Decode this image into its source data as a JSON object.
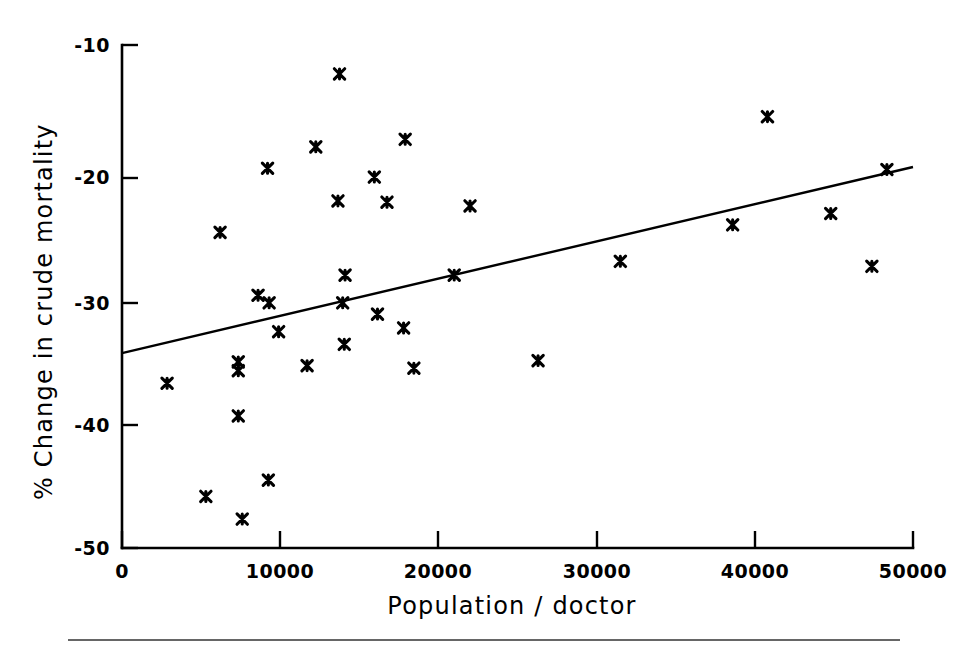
{
  "chart_data": {
    "type": "scatter",
    "title": "",
    "xlabel": "Population / doctor",
    "ylabel": "% Change in crude mortality",
    "xlim": [
      0,
      50000
    ],
    "ylim": [
      -50,
      -10
    ],
    "xticks": [
      0,
      10000,
      20000,
      30000,
      40000,
      50000
    ],
    "xtick_labels": [
      "0",
      "10000",
      "20000",
      "30000",
      "40000",
      "50000"
    ],
    "yticks": [
      -10,
      -20,
      -30,
      -40,
      -50
    ],
    "ytick_labels": [
      "-10",
      "-20",
      "-30",
      "-40",
      "-50"
    ],
    "grid": false,
    "legend": null,
    "marker": "x-star",
    "points": [
      {
        "x": 2850,
        "y": -36.9
      },
      {
        "x": 5300,
        "y": -45.9
      },
      {
        "x": 6200,
        "y": -24.9
      },
      {
        "x": 7350,
        "y": -35.2
      },
      {
        "x": 7350,
        "y": -35.9
      },
      {
        "x": 7350,
        "y": -39.5
      },
      {
        "x": 7600,
        "y": -47.7
      },
      {
        "x": 8600,
        "y": -29.9
      },
      {
        "x": 9200,
        "y": -19.8
      },
      {
        "x": 9250,
        "y": -44.6
      },
      {
        "x": 9300,
        "y": -30.5
      },
      {
        "x": 9900,
        "y": -32.8
      },
      {
        "x": 11700,
        "y": -35.5
      },
      {
        "x": 12250,
        "y": -18.1
      },
      {
        "x": 13650,
        "y": -22.4
      },
      {
        "x": 13750,
        "y": -12.3
      },
      {
        "x": 13950,
        "y": -30.5
      },
      {
        "x": 14100,
        "y": -28.3
      },
      {
        "x": 14050,
        "y": -33.8
      },
      {
        "x": 15950,
        "y": -20.5
      },
      {
        "x": 16150,
        "y": -31.4
      },
      {
        "x": 16750,
        "y": -22.5
      },
      {
        "x": 17800,
        "y": -32.5
      },
      {
        "x": 17900,
        "y": -17.5
      },
      {
        "x": 18450,
        "y": -35.7
      },
      {
        "x": 21000,
        "y": -28.3
      },
      {
        "x": 22000,
        "y": -22.8
      },
      {
        "x": 26300,
        "y": -35.1
      },
      {
        "x": 31500,
        "y": -27.2
      },
      {
        "x": 38600,
        "y": -24.3
      },
      {
        "x": 40800,
        "y": -15.7
      },
      {
        "x": 44800,
        "y": -23.4
      },
      {
        "x": 47400,
        "y": -27.6
      },
      {
        "x": 48350,
        "y": -19.9
      }
    ],
    "fit_line": {
      "x0": 0,
      "y0": -34.5,
      "x1": 50000,
      "y1": -19.7
    }
  },
  "figure": {
    "background_color": "#ffffff",
    "ink_color": "#000000",
    "bottom_rule": true
  }
}
